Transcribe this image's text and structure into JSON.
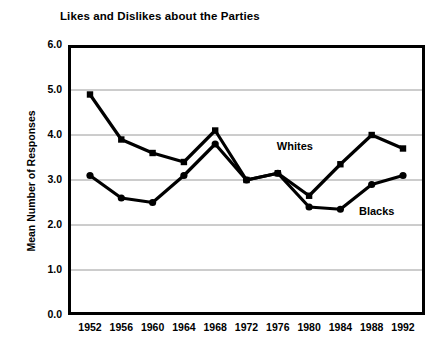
{
  "chart_data": {
    "type": "line",
    "title": "Likes and Dislikes about the Parties",
    "xlabel": "",
    "ylabel": "Mean Number of Responses",
    "categories": [
      "1952",
      "1956",
      "1960",
      "1964",
      "1968",
      "1972",
      "1976",
      "1980",
      "1984",
      "1988",
      "1992"
    ],
    "x": [
      1952,
      1956,
      1960,
      1964,
      1968,
      1972,
      1976,
      1980,
      1984,
      1988,
      1992
    ],
    "ylim": [
      0.0,
      6.0
    ],
    "ytick_labels": [
      "0.0",
      "1.0",
      "2.0",
      "3.0",
      "4.0",
      "5.0",
      "6.0"
    ],
    "ytick_values": [
      0.0,
      1.0,
      2.0,
      3.0,
      4.0,
      5.0,
      6.0
    ],
    "grid": true,
    "grid_axis": "y",
    "legend_position": "inline-annotation",
    "series": [
      {
        "name": "Whites",
        "marker": "square",
        "color": "#000000",
        "values": [
          4.9,
          3.9,
          3.6,
          3.4,
          4.1,
          3.0,
          3.15,
          2.65,
          3.35,
          4.0,
          3.7
        ]
      },
      {
        "name": "Blacks",
        "marker": "circle",
        "color": "#000000",
        "values": [
          3.1,
          2.6,
          2.5,
          3.1,
          3.8,
          3.0,
          3.15,
          2.4,
          2.35,
          2.9,
          3.1
        ]
      }
    ],
    "annotations": [
      {
        "text": "Whites",
        "x_frac": 0.585,
        "y_value": 3.72
      },
      {
        "text": "Blacks",
        "x_frac": 0.815,
        "y_value": 2.27
      }
    ]
  }
}
